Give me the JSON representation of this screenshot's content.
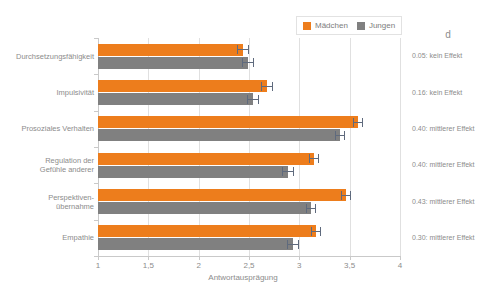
{
  "chart_data": {
    "type": "bar",
    "orientation": "horizontal",
    "title": "",
    "xlabel": "Antwortausprägung",
    "ylabel": "",
    "xlim": [
      1,
      4
    ],
    "xticks": [
      "1",
      "1,5",
      "2",
      "2,5",
      "3",
      "3,5",
      "4"
    ],
    "xtick_values": [
      1,
      1.5,
      2,
      2.5,
      3,
      3.5,
      4
    ],
    "grid": true,
    "legend_position": "top-right",
    "categories": [
      "Durchsetzungsfähigkeit",
      "Impulsivität",
      "Prosoziales Verhalten",
      "Regulation der\nGefühle anderer",
      "Perspektiven-\nübernahme",
      "Empathie"
    ],
    "series": [
      {
        "name": "Mädchen",
        "color": "#ED7D1C",
        "values": [
          2.44,
          2.68,
          3.58,
          3.15,
          3.46,
          3.17
        ],
        "errors": [
          0.06,
          0.06,
          0.05,
          0.05,
          0.05,
          0.05
        ]
      },
      {
        "name": "Jungen",
        "color": "#808080",
        "values": [
          2.49,
          2.54,
          3.4,
          2.89,
          3.12,
          2.94
        ],
        "errors": [
          0.06,
          0.06,
          0.05,
          0.06,
          0.05,
          0.06
        ]
      }
    ],
    "annotation_column": {
      "header": "d",
      "values": [
        "0.05: kein Effekt",
        "0.16: kein Effekt",
        "0.40: mittlerer Effekt",
        "0.40: mittlerer Effekt",
        "0.43: mittlerer Effekt",
        "0.30: mittlerer Effekt"
      ]
    }
  },
  "legend": {
    "entries": [
      {
        "label": "Mädchen",
        "color": "#ED7D1C"
      },
      {
        "label": "Jungen",
        "color": "#808080"
      }
    ]
  },
  "colors": {
    "girls": "#ED7D1C",
    "boys": "#808080",
    "grid": "#e0e0e0",
    "axis": "#c9c9c9",
    "text": "#8c8c8c",
    "error_bar": "#5f6a7d"
  }
}
